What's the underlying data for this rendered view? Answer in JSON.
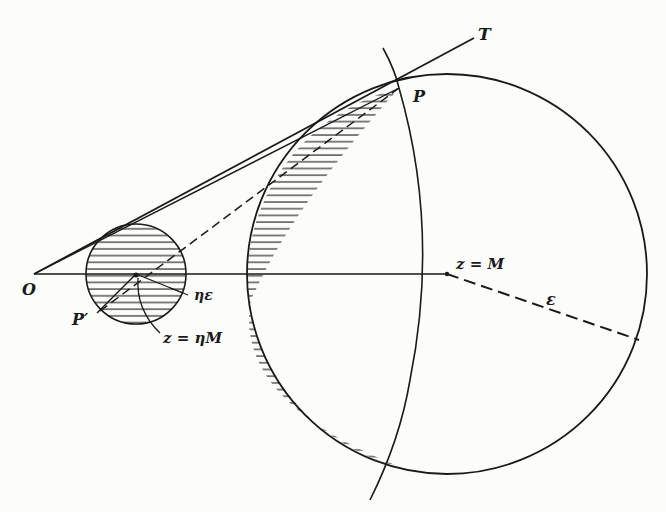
{
  "figure": {
    "labels": {
      "T": "T",
      "P": "P",
      "O": "O",
      "P_prime": "P′",
      "z_M": "z = M",
      "z_etaM": "z = ηM",
      "eta_eps": "ηε",
      "eps": "ε"
    },
    "colors": {
      "ink": "#1a1a1a",
      "paper": "#fcfcfb"
    }
  }
}
